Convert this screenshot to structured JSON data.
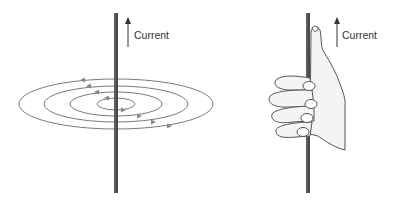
{
  "diagram": {
    "left_panel": {
      "label": "Current",
      "description": "Concentric magnetic field loops around a straight current-carrying wire"
    },
    "right_panel": {
      "label": "Current",
      "description": "Right-hand grip rule: thumb along current, fingers curl in field direction"
    },
    "colors": {
      "wire": "#444444",
      "lines": "#777777",
      "text": "#333333",
      "hand_fill": "#f4f4f4"
    }
  }
}
